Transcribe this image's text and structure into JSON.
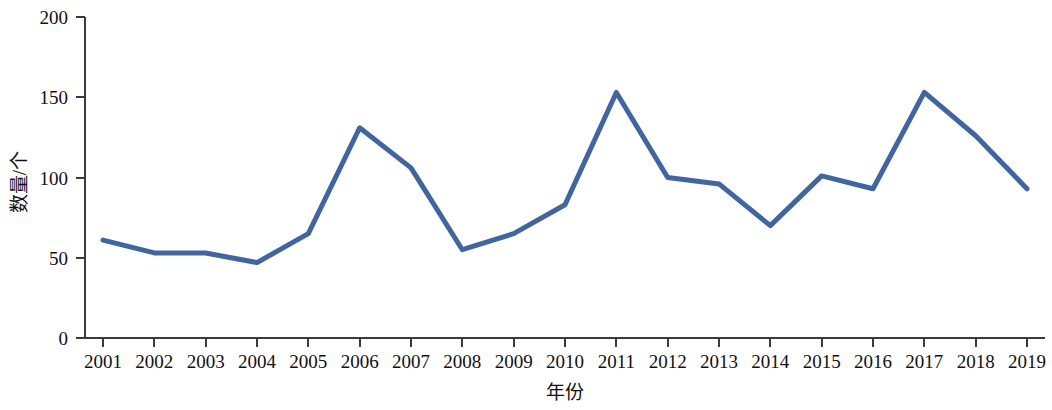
{
  "chart_data": {
    "type": "line",
    "title": "",
    "subtitle": "",
    "xlabel": "年份",
    "ylabel": "数量/个",
    "categories": [
      "2001",
      "2002",
      "2003",
      "2004",
      "2005",
      "2006",
      "2007",
      "2008",
      "2009",
      "2010",
      "2011",
      "2012",
      "2013",
      "2014",
      "2015",
      "2016",
      "2017",
      "2018",
      "2019"
    ],
    "x": [
      2001,
      2002,
      2003,
      2004,
      2005,
      2006,
      2007,
      2008,
      2009,
      2010,
      2011,
      2012,
      2013,
      2014,
      2015,
      2016,
      2017,
      2018,
      2019
    ],
    "values": [
      61,
      53,
      53,
      47,
      65,
      131,
      106,
      55,
      65,
      83,
      153,
      100,
      96,
      70,
      101,
      93,
      153,
      126,
      93
    ],
    "series": [
      {
        "name": "数量",
        "color": "#41659E",
        "values": [
          61,
          53,
          53,
          47,
          65,
          131,
          106,
          55,
          65,
          83,
          153,
          100,
          96,
          70,
          101,
          93,
          153,
          126,
          93
        ]
      }
    ],
    "ylim": [
      0,
      200
    ],
    "yticks": [
      0,
      50,
      100,
      150,
      200
    ],
    "ytick_labels": [
      "0",
      "50",
      "100",
      "150",
      "200"
    ],
    "xtick_labels": [
      "2001",
      "2002",
      "2003",
      "2004",
      "2005",
      "2006",
      "2007",
      "2008",
      "2009",
      "2010",
      "2011",
      "2012",
      "2013",
      "2014",
      "2015",
      "2016",
      "2017",
      "2018",
      "2019"
    ],
    "grid": false,
    "legend": false,
    "legend_position": "none",
    "markers": false,
    "line_width": 5,
    "accent_color": "#41659E",
    "axis_color": "#3a3a3a",
    "background_color": "#ffffff"
  }
}
